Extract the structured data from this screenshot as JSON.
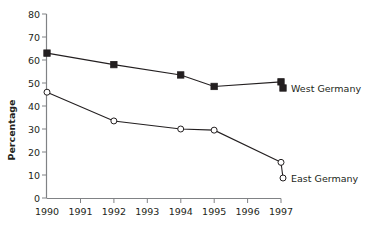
{
  "chart_data": {
    "type": "line",
    "title": "",
    "xlabel": "",
    "ylabel": "Percentage",
    "x": [
      1990,
      1991,
      1992,
      1993,
      1994,
      1995,
      1996,
      1997
    ],
    "xtick_labels": [
      "1990",
      "1991",
      "1992",
      "1993",
      "1994",
      "1995",
      "1996",
      "1997"
    ],
    "xlim": [
      1990,
      1997
    ],
    "ylim": [
      0,
      80
    ],
    "ytick_labels": [
      "0",
      "10",
      "20",
      "30",
      "40",
      "50",
      "60",
      "70",
      "80"
    ],
    "yticks": [
      0,
      10,
      20,
      30,
      40,
      50,
      60,
      70,
      80
    ],
    "grid": false,
    "legend_position": "right-inline",
    "series": [
      {
        "name": "West Germany",
        "marker": "filled-square",
        "color": "#231f20",
        "x": [
          1990,
          1992,
          1994,
          1995,
          1997
        ],
        "values": [
          63,
          58,
          53.5,
          48.5,
          50.5
        ]
      },
      {
        "name": "East Germany",
        "marker": "open-circle",
        "color": "#231f20",
        "x": [
          1990,
          1992,
          1994,
          1995,
          1997
        ],
        "values": [
          46,
          33.5,
          30,
          29.5,
          15.5
        ]
      }
    ]
  },
  "axis": {
    "y_label": "Percentage"
  },
  "labels": {
    "west_germany": "West Germany",
    "east_germany": "East Germany"
  },
  "ticks": {
    "y": [
      "80",
      "70",
      "60",
      "50",
      "40",
      "30",
      "20",
      "10",
      "0"
    ],
    "x": [
      "1990",
      "1991",
      "1992",
      "1993",
      "1994",
      "1995",
      "1996",
      "1997"
    ]
  }
}
